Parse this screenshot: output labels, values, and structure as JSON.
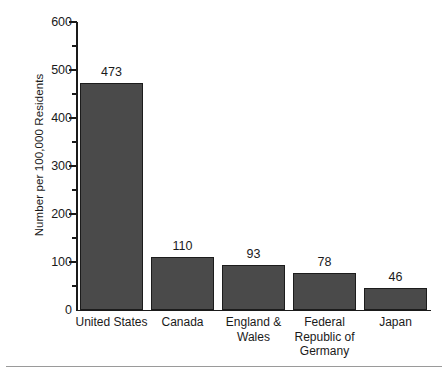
{
  "chart_data": {
    "type": "bar",
    "title": "",
    "subtitle": "",
    "xlabel": "",
    "ylabel": "Number per 100,000 Residents",
    "categories": [
      "United States",
      "Canada",
      "England & Wales",
      "Federal Republic of Germany",
      "Japan"
    ],
    "values": [
      473,
      110,
      93,
      78,
      46
    ],
    "data_labels": [
      "473",
      "110",
      "93",
      "78",
      "46"
    ],
    "ylim": [
      0,
      600
    ],
    "ytick_labels": [
      "0",
      "100",
      "200",
      "300",
      "400",
      "500",
      "600"
    ],
    "ytick_values": [
      0,
      100,
      200,
      300,
      400,
      500,
      600
    ],
    "yminor_tick_values": [
      50,
      150,
      250,
      350,
      450,
      550
    ],
    "grid": false,
    "legend": false,
    "legend_position": "none",
    "bar_color": "#4a4a4a",
    "bar_edge_color": "#1c1c1c",
    "axis_color": "#1a1a1a",
    "background_color": "#ffffff"
  },
  "category_label_lines": [
    [
      "United States"
    ],
    [
      "Canada"
    ],
    [
      "England &",
      "Wales"
    ],
    [
      "Federal",
      "Republic of",
      "Germany"
    ],
    [
      "Japan"
    ]
  ],
  "footer": {
    "rule": ""
  }
}
